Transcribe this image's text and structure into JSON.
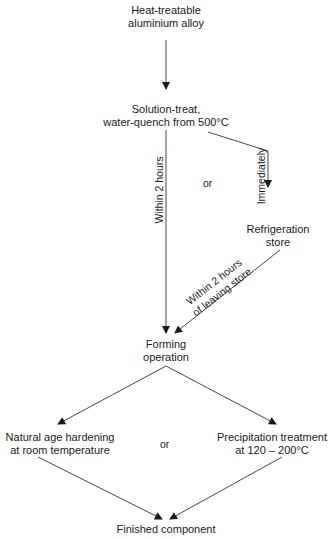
{
  "nodes": {
    "start": {
      "line1": "Heat-treatable",
      "line2": "aluminium alloy"
    },
    "solution": {
      "line1": "Solution-treat,",
      "line2": "water-quench from 500°C"
    },
    "refrigeration": {
      "line1": "Refrigeration",
      "line2": "store"
    },
    "forming": {
      "line1": "Forming",
      "line2": "operation"
    },
    "natural": {
      "line1": "Natural age hardening",
      "line2": "at room temperature"
    },
    "precipitation": {
      "line1": "Precipitation treatment",
      "line2": "at 120 – 200°C"
    },
    "finished": {
      "line1": "Finished component"
    }
  },
  "labels": {
    "within_2_hours": "Within 2 hours",
    "or_top": "or",
    "immediately": "Immediately",
    "leaving_line1": "Within 2 hours",
    "leaving_line2": "of leaving store",
    "or_bottom": "or"
  }
}
